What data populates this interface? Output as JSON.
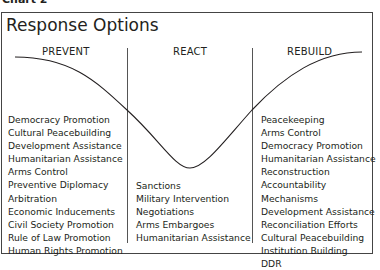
{
  "chart_label": "Chart 2",
  "title": "Response Options",
  "columns": [
    {
      "heading": "PREVENT",
      "items": [
        "Democracy Promotion",
        "Cultural Peacebuilding",
        "Development Assistance",
        "Humanitarian Assistance",
        "Arms Control",
        "Preventive Diplomacy",
        "Arbitration",
        "Economic Inducements",
        "Civil Society Promotion",
        "Rule of Law Promotion",
        "Human Rights Promotion"
      ]
    },
    {
      "heading": "REACT",
      "items": [
        "Sanctions",
        "Military Intervention",
        "Negotiations",
        "Arms Embargoes",
        "Humanitarian Assistance"
      ]
    },
    {
      "heading": "REBUILD",
      "items": [
        "Peacekeeping",
        "Arms Control",
        "Democracy Promotion",
        "Humanitarian Assistance",
        "Reconstruction",
        "Accountability Mechanisms",
        "Development Assistance",
        "Reconciliation Efforts",
        "Cultural Peacebuilding",
        "Institution Building",
        "DDR"
      ]
    }
  ],
  "colors": {
    "line": "#231f20",
    "border": "#444444"
  }
}
